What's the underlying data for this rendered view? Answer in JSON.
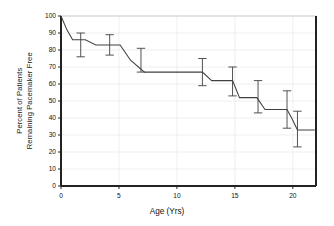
{
  "figure": {
    "width": 334,
    "height": 226,
    "background": "#ffffff",
    "line_color": "#404040",
    "axis_color": "#222222",
    "grid_color": "#e8e8e8"
  },
  "chart_data": {
    "type": "line",
    "title": "",
    "subtitle": "",
    "xlabel": "Age (Yrs)",
    "ylabel": "Percent of Patients Remaining Pacemaker Free",
    "ylabel_line1": "Percent of Patients",
    "ylabel_line2": "Remaining Pacemaker Free",
    "xlim": [
      0,
      22
    ],
    "ylim": [
      0,
      100
    ],
    "xticks": [
      0,
      5,
      10,
      15,
      20
    ],
    "xticklabels": [
      "0",
      "5",
      "10",
      "15",
      "20"
    ],
    "yticks": [
      0,
      10,
      20,
      30,
      40,
      50,
      60,
      70,
      80,
      90,
      100
    ],
    "yticklabels": [
      "0",
      "10",
      "20",
      "30",
      "40",
      "50",
      "60",
      "70",
      "80",
      "90",
      "100"
    ],
    "grid": true,
    "grid_axis": "y",
    "legend": "none",
    "step_style": "post",
    "series": [
      {
        "name": "Pacemaker-free survival",
        "x": [
          0.0,
          0.5,
          1.0,
          2.1,
          3.0,
          5.1,
          6.0,
          7.2,
          12.2,
          13.0,
          14.8,
          15.4,
          16.9,
          17.6,
          19.5,
          19.9,
          20.4,
          21.9
        ],
        "y": [
          100,
          92,
          86,
          86,
          83,
          83,
          74,
          67,
          67,
          62,
          62,
          52,
          52,
          45,
          45,
          40,
          33,
          33
        ]
      }
    ],
    "error_bars": [
      {
        "x": 1.7,
        "y": 83,
        "lower": 76,
        "upper": 90
      },
      {
        "x": 4.2,
        "y": 83,
        "lower": 77,
        "upper": 89
      },
      {
        "x": 6.9,
        "y": 74,
        "lower": 67,
        "upper": 81
      },
      {
        "x": 12.2,
        "y": 67,
        "lower": 59,
        "upper": 75
      },
      {
        "x": 14.8,
        "y": 62,
        "lower": 53,
        "upper": 70
      },
      {
        "x": 17.0,
        "y": 52,
        "lower": 43,
        "upper": 62
      },
      {
        "x": 19.5,
        "y": 45,
        "lower": 34,
        "upper": 56
      },
      {
        "x": 20.4,
        "y": 33,
        "lower": 23,
        "upper": 44
      }
    ]
  }
}
